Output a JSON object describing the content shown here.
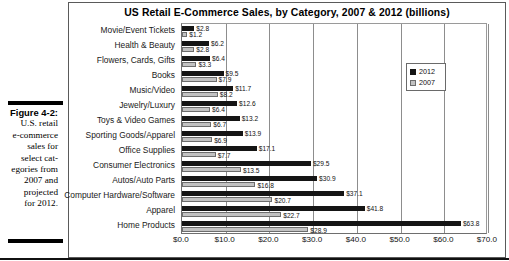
{
  "figure": {
    "number": "Figure 4-2:",
    "caption_lines": [
      "U.S. retail",
      "e-commerce",
      "sales for",
      "select cat-",
      "egories from",
      "2007 and",
      "projected",
      "for 2012."
    ]
  },
  "chart": {
    "title": "US Retail E-Commerce Sales, by Category, 2007 & 2012 (billions)",
    "legend": {
      "position": "inside-top-right",
      "entries": [
        "2012",
        "2007"
      ]
    },
    "axis": {
      "ticks": [
        "$0.0",
        "$10.0",
        "$20.0",
        "$30.0",
        "$40.0",
        "$50.0",
        "$60.0",
        "$70.0"
      ]
    },
    "colors": {
      "series_2012": "#151515",
      "series_2007": "#c2c2c2",
      "grid": "#8d8d8d"
    }
  },
  "chart_data": {
    "type": "bar",
    "orientation": "horizontal",
    "title": "US Retail E-Commerce Sales, by Category, 2007 & 2012 (billions)",
    "xlabel": "",
    "ylabel": "",
    "xlim": [
      0,
      70
    ],
    "xticks": [
      0,
      10,
      20,
      30,
      40,
      50,
      60,
      70
    ],
    "xtick_labels": [
      "$0.0",
      "$10.0",
      "$20.0",
      "$30.0",
      "$40.0",
      "$50.0",
      "$60.0",
      "$70.0"
    ],
    "grid": true,
    "legend": [
      "2012",
      "2007"
    ],
    "categories": [
      "Movie/Event Tickets",
      "Health & Beauty",
      "Flowers, Cards, Gifts",
      "Books",
      "Music/Video",
      "Jewelry/Luxury",
      "Toys & Video Games",
      "Sporting Goods/Apparel",
      "Office Supplies",
      "Consumer Electronics",
      "Autos/Auto Parts",
      "Computer Hardware/Software",
      "Apparel",
      "Home Products"
    ],
    "series": [
      {
        "name": "2012",
        "values": [
          2.8,
          6.2,
          6.4,
          9.5,
          11.7,
          12.6,
          13.2,
          13.9,
          17.1,
          29.5,
          30.9,
          37.1,
          41.8,
          63.8
        ],
        "labels": [
          "$2.8",
          "$6.2",
          "$6.4",
          "$9.5",
          "$11.7",
          "$12.6",
          "$13.2",
          "$13.9",
          "$17.1",
          "$29.5",
          "$30.9",
          "$37.1",
          "$41.8",
          "$63.8"
        ]
      },
      {
        "name": "2007",
        "values": [
          1.2,
          2.8,
          3.3,
          7.9,
          8.2,
          6.4,
          6.7,
          6.9,
          7.7,
          13.5,
          16.8,
          20.7,
          22.7,
          28.9
        ],
        "labels": [
          "$1.2",
          "$2.8",
          "$3.3",
          "$7.9",
          "$8.2",
          "$6.4",
          "$6.7",
          "$6.9",
          "$7.7",
          "$13.5",
          "$16.8",
          "$20.7",
          "$22.7",
          "$28.9"
        ]
      }
    ]
  }
}
